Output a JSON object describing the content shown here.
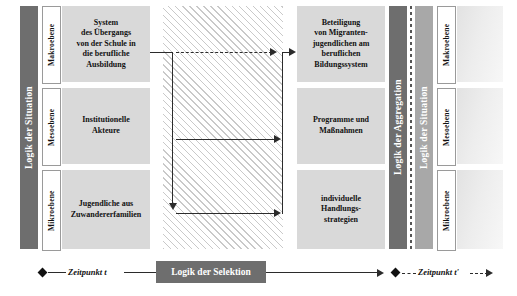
{
  "diagram": {
    "colors": {
      "phase_dark": "#6e6e6e",
      "phase_mid": "#a8a8a8",
      "box_fill": "#d9d9d9",
      "hatch_line": "#c9c9c9",
      "line": "#2b2b2b",
      "text_on_dark": "#ffffff"
    }
  },
  "left_phase": {
    "label": "Logik der Situation"
  },
  "left_levels": [
    {
      "label": "Makroebene"
    },
    {
      "label": "Mesoebene"
    },
    {
      "label": "Mikroebene"
    }
  ],
  "left_boxes": [
    {
      "name": "system-uebergang",
      "lines": [
        "System",
        "des Übergangs",
        "von der Schule in",
        "die berufliche",
        "Ausbildung"
      ]
    },
    {
      "name": "institutionelle-akteure",
      "lines": [
        "Institutionelle",
        "Akteure"
      ]
    },
    {
      "name": "jugendliche-zuwandererfamilien",
      "lines": [
        "Jugendliche aus",
        "Zuwandererfamilien"
      ]
    }
  ],
  "right_boxes": [
    {
      "name": "beteiligung-migrantenjugendliche",
      "lines": [
        "Beteiligung",
        "von Migranten-",
        "jugendlichen am",
        "beruflichen",
        "Bildungssystem"
      ]
    },
    {
      "name": "programme-massnahmen",
      "lines": [
        "Programme und",
        "Maßnahmen"
      ]
    },
    {
      "name": "individuelle-handlungsstrategien",
      "lines": [
        "individuelle",
        "Handlungs-",
        "strategien"
      ]
    }
  ],
  "right_phase_aggregation": {
    "label": "Logik der Aggregation"
  },
  "right_phase_situation": {
    "label": "Logik der Situation"
  },
  "right_levels": [
    {
      "label": "Makroebene"
    },
    {
      "label": "Mesoebene"
    },
    {
      "label": "Mikroebene"
    }
  ],
  "middle": {
    "label": ""
  },
  "timeline": {
    "start_label": "Zeitpunkt t",
    "selection_label": "Logik der Selektion",
    "end_label": "Zeitpunkt t'"
  }
}
